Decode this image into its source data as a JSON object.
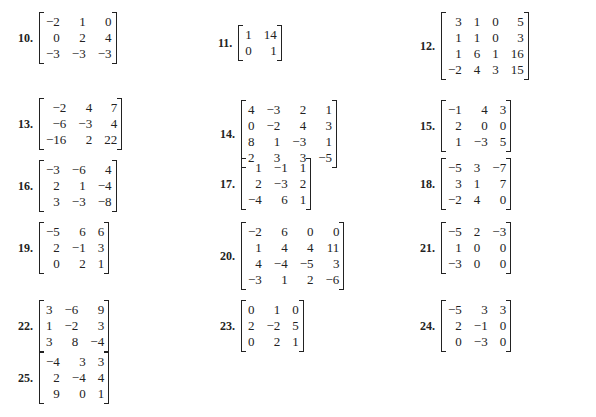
{
  "problems": [
    {
      "label": "10.",
      "rows": [
        [
          "−2",
          "1",
          "0"
        ],
        [
          "0",
          "2",
          "4"
        ],
        [
          "−3",
          "−3",
          "−3"
        ]
      ]
    },
    {
      "label": "11.",
      "rows": [
        [
          "1",
          "14"
        ],
        [
          "0",
          "1"
        ]
      ]
    },
    {
      "label": "12.",
      "rows": [
        [
          "3",
          "1",
          "0",
          "5"
        ],
        [
          "1",
          "1",
          "0",
          "3"
        ],
        [
          "1",
          "6",
          "1",
          "16"
        ],
        [
          "−2",
          "4",
          "3",
          "15"
        ]
      ]
    },
    {
      "label": "13.",
      "rows": [
        [
          "−2",
          "4",
          "7"
        ],
        [
          "−6",
          "−3",
          "4"
        ],
        [
          "−16",
          "2",
          "22"
        ]
      ]
    },
    {
      "label": "14.",
      "rows": [
        [
          "4",
          "−3",
          "2",
          "1"
        ],
        [
          "0",
          "−2",
          "4",
          "3"
        ],
        [
          "8",
          "1",
          "−3",
          "1"
        ],
        [
          "2",
          "3",
          "3",
          "−5"
        ]
      ]
    },
    {
      "label": "15.",
      "rows": [
        [
          "−1",
          "4",
          "3"
        ],
        [
          "2",
          "0",
          "0"
        ],
        [
          "1",
          "−3",
          "5"
        ]
      ]
    },
    {
      "label": "16.",
      "rows": [
        [
          "−3",
          "−6",
          "4"
        ],
        [
          "2",
          "1",
          "−4"
        ],
        [
          "3",
          "−3",
          "−8"
        ]
      ]
    },
    {
      "label": "17.",
      "rows": [
        [
          "1",
          "−1",
          "1"
        ],
        [
          "2",
          "−3",
          "2"
        ],
        [
          "−4",
          "6",
          "1"
        ]
      ]
    },
    {
      "label": "18.",
      "rows": [
        [
          "−5",
          "3",
          "−7"
        ],
        [
          "3",
          "1",
          "7"
        ],
        [
          "−2",
          "4",
          "0"
        ]
      ]
    },
    {
      "label": "19.",
      "rows": [
        [
          "−5",
          "6",
          "6"
        ],
        [
          "2",
          "−1",
          "3"
        ],
        [
          "0",
          "2",
          "1"
        ]
      ]
    },
    {
      "label": "20.",
      "rows": [
        [
          "−2",
          "6",
          "0",
          "0"
        ],
        [
          "1",
          "4",
          "4",
          "11"
        ],
        [
          "4",
          "−4",
          "−5",
          "3"
        ],
        [
          "−3",
          "1",
          "2",
          "−6"
        ]
      ]
    },
    {
      "label": "21.",
      "rows": [
        [
          "−5",
          "2",
          "−3"
        ],
        [
          "1",
          "0",
          "0"
        ],
        [
          "−3",
          "0",
          "0"
        ]
      ]
    },
    {
      "label": "22.",
      "rows": [
        [
          "3",
          "−6",
          "9"
        ],
        [
          "1",
          "−2",
          "3"
        ],
        [
          "3",
          "8",
          "−4"
        ]
      ]
    },
    {
      "label": "23.",
      "rows": [
        [
          "0",
          "1",
          "0"
        ],
        [
          "2",
          "−2",
          "5"
        ],
        [
          "0",
          "2",
          "1"
        ]
      ]
    },
    {
      "label": "24.",
      "rows": [
        [
          "−5",
          "3",
          "3"
        ],
        [
          "2",
          "−1",
          "0"
        ],
        [
          "0",
          "−3",
          "0"
        ]
      ]
    },
    {
      "label": "25.",
      "rows": [
        [
          "−4",
          "3",
          "3"
        ],
        [
          "2",
          "−4",
          "4"
        ],
        [
          "9",
          "0",
          "1"
        ]
      ]
    }
  ]
}
